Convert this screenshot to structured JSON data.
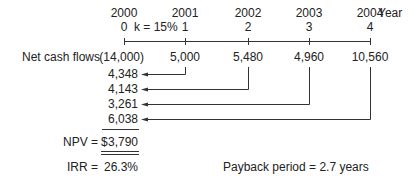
{
  "timeline": {
    "years": [
      "2000",
      "2001",
      "2002",
      "2003",
      "2004"
    ],
    "periods": [
      "0",
      "1",
      "2",
      "3",
      "4"
    ],
    "year_label": "Year",
    "rate_label": "k = 15%"
  },
  "cash_flows": {
    "label": "Net cash flows",
    "values": [
      "(14,000)",
      "5,000",
      "5,480",
      "4,960",
      "10,560"
    ]
  },
  "present_values": [
    "4,348",
    "4,143",
    "3,261",
    "6,038"
  ],
  "results": {
    "npv_label": "NPV =",
    "npv_currency": "$",
    "npv_value": "3,790",
    "irr_label": "IRR =",
    "irr_value": "26.3%",
    "payback": "Payback period = 2.7 years"
  },
  "colors": {
    "text": "#222222",
    "line": "#333333",
    "background": "#ffffff"
  }
}
